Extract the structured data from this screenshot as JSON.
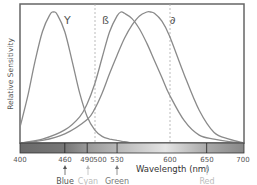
{
  "chart_data": {
    "type": "line",
    "title": "",
    "xlabel": "Wavelength (nm)",
    "ylabel": "Relative Sensitivity",
    "xlim": [
      400,
      700
    ],
    "ylim": [
      0,
      1
    ],
    "grid": false,
    "x_ticks": [
      400,
      460,
      490,
      500,
      530,
      600,
      650,
      700
    ],
    "reference_lines": [
      500,
      600
    ],
    "series": [
      {
        "name": "γ",
        "label": "Y",
        "peak": 445,
        "x": [
          400,
          410,
          420,
          430,
          440,
          445,
          450,
          460,
          470,
          480,
          490,
          500,
          510,
          520,
          530,
          540,
          550
        ],
        "values": [
          0.12,
          0.35,
          0.62,
          0.85,
          0.98,
          1.0,
          0.98,
          0.85,
          0.62,
          0.38,
          0.2,
          0.1,
          0.05,
          0.03,
          0.02,
          0.01,
          0.0
        ]
      },
      {
        "name": "β",
        "label": "ß",
        "peak": 535,
        "x": [
          400,
          430,
          460,
          480,
          490,
          500,
          510,
          520,
          530,
          535,
          540,
          550,
          560,
          570,
          580,
          590,
          600,
          620,
          640,
          660,
          680,
          700
        ],
        "values": [
          0.0,
          0.03,
          0.1,
          0.2,
          0.3,
          0.45,
          0.65,
          0.85,
          0.97,
          1.0,
          0.99,
          0.95,
          0.87,
          0.76,
          0.63,
          0.5,
          0.37,
          0.17,
          0.06,
          0.03,
          0.01,
          0.0
        ]
      },
      {
        "name": "δ",
        "label": "∂",
        "peak": 575,
        "x": [
          400,
          430,
          460,
          490,
          500,
          510,
          520,
          530,
          540,
          550,
          560,
          570,
          575,
          580,
          590,
          600,
          620,
          640,
          660,
          680,
          700
        ],
        "values": [
          0.0,
          0.02,
          0.07,
          0.18,
          0.26,
          0.38,
          0.53,
          0.67,
          0.8,
          0.9,
          0.97,
          1.0,
          1.0,
          0.99,
          0.93,
          0.82,
          0.52,
          0.25,
          0.08,
          0.03,
          0.0
        ]
      }
    ],
    "spectrum_bar": {
      "boundaries": [
        400,
        460,
        490,
        530,
        650,
        700
      ]
    },
    "color_markers": [
      {
        "name": "Blue",
        "x": 460,
        "color": "#555555"
      },
      {
        "name": "Cyan",
        "x": 490,
        "color": "#b8b8b8"
      },
      {
        "name": "Green",
        "x": 530,
        "color": "#777777"
      },
      {
        "name": "Red",
        "x": 650,
        "color": "#b0b0b0"
      }
    ]
  },
  "labels": {
    "ylabel": "Relative Sensitivity",
    "xlabel": "Wavelength (nm)",
    "gamma": "Y",
    "beta": "ß",
    "delta": "∂",
    "ticks": [
      "400",
      "460",
      "490",
      "500",
      "530",
      "600",
      "650",
      "700"
    ],
    "blue": "Blue",
    "cyan": "Cyan",
    "green": "Green",
    "red": "Red"
  },
  "colors": {
    "curve": "#8a8a8a",
    "frame": "#666666",
    "dashed": "#aaaaaa"
  }
}
